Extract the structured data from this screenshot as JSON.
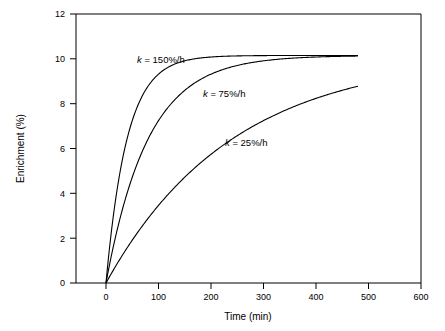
{
  "chart_data": {
    "type": "line",
    "title": "",
    "xlabel": "Time (min)",
    "ylabel": "Enrichment (%)",
    "xlim": [
      0,
      600
    ],
    "ylim": [
      0,
      12
    ],
    "xticks": [
      0,
      100,
      200,
      300,
      400,
      500,
      600
    ],
    "xtick_labels": [
      "0",
      "100",
      "200",
      "300",
      "400",
      "500",
      "600"
    ],
    "yticks": [
      0,
      2,
      4,
      6,
      8,
      10,
      12
    ],
    "ytick_labels": [
      "0",
      "2",
      "4",
      "6",
      "8",
      "10",
      "12"
    ],
    "grid": false,
    "legend_position": "inline-annotations",
    "series": [
      {
        "name": "k = 150%/h",
        "label": "k = 150%/h",
        "plateau": 10.15,
        "rate_per_min": 0.025,
        "x": [
          0,
          10,
          20,
          30,
          40,
          50,
          60,
          80,
          100,
          120,
          150,
          200,
          250,
          300,
          350,
          400,
          450,
          480
        ],
        "y": [
          0,
          2.24,
          3.99,
          5.35,
          6.41,
          7.24,
          7.88,
          8.77,
          9.32,
          9.65,
          9.91,
          10.08,
          10.13,
          10.15,
          10.15,
          10.15,
          10.15,
          10.15
        ]
      },
      {
        "name": "k = 75%/h",
        "label": "k = 75%/h",
        "plateau": 10.15,
        "rate_per_min": 0.0125,
        "x": [
          0,
          20,
          40,
          60,
          80,
          100,
          120,
          150,
          200,
          250,
          300,
          350,
          400,
          450,
          480
        ],
        "y": [
          0,
          2.24,
          3.99,
          5.35,
          6.41,
          7.24,
          7.88,
          8.59,
          9.32,
          9.71,
          9.91,
          10.01,
          10.07,
          10.11,
          10.12
        ]
      },
      {
        "name": "k = 25%/h",
        "label": "k = 25%/h",
        "plateau": 10.15,
        "rate_per_min": 0.00417,
        "x": [
          0,
          40,
          80,
          120,
          160,
          200,
          240,
          280,
          320,
          360,
          400,
          440,
          480
        ],
        "y": [
          0,
          1.57,
          2.9,
          4.02,
          4.97,
          5.78,
          6.46,
          7.04,
          7.53,
          7.95,
          8.3,
          8.6,
          8.85
        ]
      }
    ],
    "annotations": [
      {
        "text_italic": "k",
        "text_rest": " = 150%/h",
        "x_data": 60,
        "y_data": 11.0
      },
      {
        "text_italic": "k",
        "text_rest": " = 75%/h",
        "x_data": 185,
        "y_data": 9.05
      },
      {
        "text_italic": "k",
        "text_rest": " = 25%/h",
        "x_data": 225,
        "y_data": 6.35
      }
    ]
  }
}
